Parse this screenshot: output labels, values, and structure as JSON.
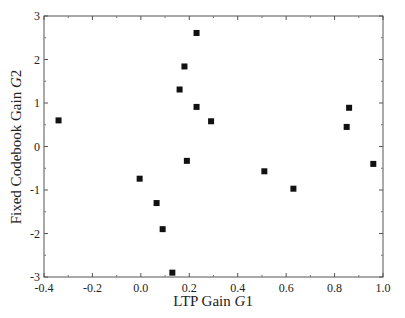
{
  "chart_data": {
    "type": "scatter",
    "title": "",
    "xlabel": "LTP Gain G1",
    "xlabel_parts": {
      "text": "LTP Gain ",
      "italic": "G",
      "suffix": "1"
    },
    "ylabel": "Fixed Codebook Gain G2",
    "ylabel_parts": {
      "text": "Fixed Codebook Gain ",
      "italic": "G",
      "suffix": "2"
    },
    "xlim": [
      -0.4,
      1.0
    ],
    "ylim": [
      -3,
      3
    ],
    "xticks": [
      "-0.4",
      "-0.2",
      "0.0",
      "0.2",
      "0.4",
      "0.6",
      "0.8",
      "1.0"
    ],
    "yticks": [
      "3",
      "2",
      "1",
      "0",
      "-1",
      "-2",
      "-3"
    ],
    "grid": false,
    "legend": null,
    "marker": "square",
    "marker_color": "#111111",
    "points": [
      {
        "x": -0.34,
        "y": 0.6
      },
      {
        "x": 0.23,
        "y": 2.61
      },
      {
        "x": 0.18,
        "y": 1.84
      },
      {
        "x": 0.16,
        "y": 1.31
      },
      {
        "x": 0.23,
        "y": 0.91
      },
      {
        "x": 0.29,
        "y": 0.58
      },
      {
        "x": 0.19,
        "y": -0.33
      },
      {
        "x": -0.005,
        "y": -0.74
      },
      {
        "x": 0.065,
        "y": -1.3
      },
      {
        "x": 0.09,
        "y": -1.9
      },
      {
        "x": 0.13,
        "y": -2.9
      },
      {
        "x": 0.51,
        "y": -0.57
      },
      {
        "x": 0.63,
        "y": -0.97
      },
      {
        "x": 0.86,
        "y": 0.89
      },
      {
        "x": 0.85,
        "y": 0.45
      },
      {
        "x": 0.96,
        "y": -0.4
      }
    ]
  }
}
